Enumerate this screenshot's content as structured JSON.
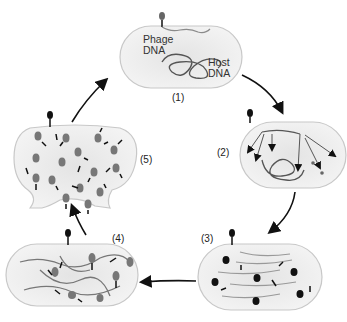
{
  "diagram": {
    "type": "lytic-cycle",
    "steps": [
      {
        "id": 1,
        "label": "(1)"
      },
      {
        "id": 2,
        "label": "(2)"
      },
      {
        "id": 3,
        "label": "(3)"
      },
      {
        "id": 4,
        "label": "(4)"
      },
      {
        "id": 5,
        "label": "(5)"
      }
    ],
    "annotations": {
      "phage_dna": "Phage\nDNA",
      "phage_dna_l1": "Phage",
      "phage_dna_l2": "DNA",
      "host_dna_l1": "Host",
      "host_dna_l2": "DNA"
    },
    "colors": {
      "cell_fill": "#ececec",
      "cell_stroke": "#c8c8c8",
      "dna": "#555555",
      "phage_dna": "#8a8a8a",
      "phage_head": "#777777",
      "arrow": "#111111"
    }
  }
}
